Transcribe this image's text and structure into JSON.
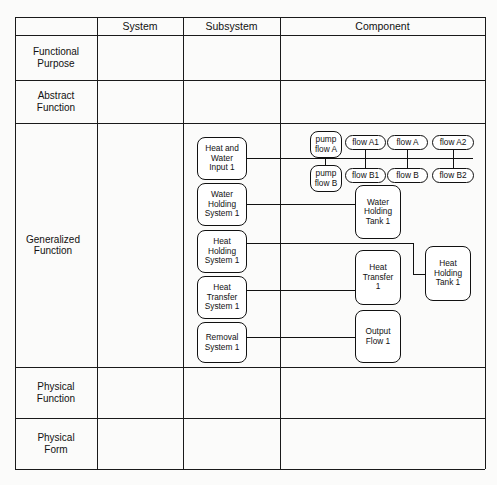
{
  "table": {
    "columns": [
      "",
      "System",
      "Subsystem",
      "Component"
    ],
    "rows": [
      {
        "label": "Functional\nPurpose"
      },
      {
        "label": "Abstract\nFunction"
      },
      {
        "label": "Generalized\nFunction"
      },
      {
        "label": "Physical\nFunction"
      },
      {
        "label": "Physical\nForm"
      }
    ]
  },
  "subsystems": [
    "Heat and\nWater\nInput 1",
    "Water\nHolding\nSystem 1",
    "Heat\nHolding\nSystem 1",
    "Heat\nTransfer\nSystem 1",
    "Removal\nSystem 1"
  ],
  "components": {
    "pump_flow_a": "pump\nflow A",
    "pump_flow_b": "pump\nflow B",
    "flow_a1": "flow A1",
    "flow_a": "flow A",
    "flow_a2": "flow A2",
    "flow_b1": "flow B1",
    "flow_b": "flow B",
    "flow_b2": "flow B2",
    "water_holding_tank": "Water\nHolding\nTank 1",
    "heat_holding_tank": "Heat\nHolding\nTank 1",
    "heat_transfer": "Heat\nTransfer\n1",
    "output_flow": "Output\nFlow 1"
  }
}
